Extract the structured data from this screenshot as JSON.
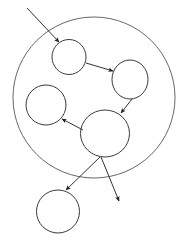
{
  "canvas": {
    "width": 189,
    "height": 245,
    "background_color": "#ffffff",
    "title": "Node Graph Diagram"
  },
  "style": {
    "boundary_stroke_color": "#555555",
    "node_stroke_color": "#3a3a3a",
    "edge_stroke_color": "#333333",
    "arrowhead_fill_color": "#222222",
    "node_fill": "none",
    "boundary_stroke_width": 0.9,
    "node_stroke_width": 1.0,
    "edge_stroke_width": 1.0
  },
  "boundary": {
    "id": "outer-boundary",
    "shape": "ellipse",
    "cx": 94,
    "cy": 97.5,
    "rx": 81,
    "ry": 80.5
  },
  "nodes": [
    {
      "id": "node-top",
      "shape": "ellipse",
      "cx": 69,
      "cy": 57,
      "rx": 17,
      "ry": 17.5,
      "inside_boundary": true
    },
    {
      "id": "node-right",
      "shape": "ellipse",
      "cx": 130,
      "cy": 79.5,
      "rx": 18,
      "ry": 19.5,
      "inside_boundary": true
    },
    {
      "id": "node-left",
      "shape": "ellipse",
      "cx": 46,
      "cy": 105,
      "rx": 20,
      "ry": 20,
      "inside_boundary": true
    },
    {
      "id": "node-hub",
      "shape": "ellipse",
      "cx": 105,
      "cy": 133.5,
      "rx": 24.5,
      "ry": 23.5,
      "inside_boundary": true
    },
    {
      "id": "node-bottom",
      "shape": "ellipse",
      "cx": 58,
      "cy": 211.5,
      "rx": 21.5,
      "ry": 21.5,
      "inside_boundary": false
    }
  ],
  "edges": [
    {
      "id": "edge-external-in",
      "from": "external-source",
      "to": "node-top",
      "x1": 27,
      "y1": 8,
      "x2": 59,
      "y2": 42,
      "arrowhead": "end",
      "crosses_boundary": true
    },
    {
      "id": "edge-top-to-right",
      "from": "node-top",
      "to": "node-right",
      "x1": 86,
      "y1": 63,
      "x2": 113,
      "y2": 71,
      "arrowhead": "end",
      "crosses_boundary": false
    },
    {
      "id": "edge-right-to-hub",
      "from": "node-right",
      "to": "node-hub",
      "x1": 132,
      "y1": 99,
      "x2": 121,
      "y2": 113,
      "arrowhead": "end",
      "crosses_boundary": false
    },
    {
      "id": "edge-hub-to-left",
      "from": "node-hub",
      "to": "node-left",
      "x1": 83,
      "y1": 130,
      "x2": 62,
      "y2": 119,
      "arrowhead": "end",
      "crosses_boundary": false
    },
    {
      "id": "edge-hub-to-bottom",
      "from": "node-hub",
      "to": "node-bottom",
      "x1": 100,
      "y1": 157,
      "x2": 66,
      "y2": 190,
      "arrowhead": "end",
      "crosses_boundary": true
    },
    {
      "id": "edge-hub-to-external",
      "from": "node-hub",
      "to": "external-sink",
      "x1": 101,
      "y1": 157,
      "x2": 119,
      "y2": 201,
      "arrowhead": "end",
      "crosses_boundary": true
    }
  ]
}
